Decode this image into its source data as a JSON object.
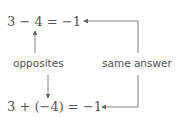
{
  "diagram": {
    "top_equation": "3 − 4 = −1",
    "bottom_equation": "3 + (−4) = −1",
    "left_label": "opposites",
    "right_label": "same answer",
    "colors": {
      "text": "#555555",
      "arrow": "#666666",
      "background": "#ffffff"
    }
  }
}
